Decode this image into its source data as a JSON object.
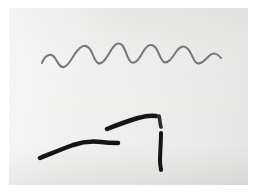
{
  "image": {
    "title": "Photographed paper with hand-drawn ink strokes",
    "canvas": {
      "width": 256,
      "height": 195
    },
    "background_color": "#ffffff",
    "plate": {
      "name": "photo-plate",
      "x": 9,
      "y": 8,
      "width": 239,
      "height": 177,
      "paper_color": "#ececeb",
      "grain": "subtle vertical paper texture, slightly darker toward right and bottom"
    },
    "ink_colors": {
      "wave": "#6d6d6d",
      "stroke_dark": "#151515",
      "stroke_mid": "#2a2a2a"
    },
    "strokes": [
      {
        "name": "sine-wave",
        "kind": "wavy-line",
        "color": "#6d6d6d",
        "stroke_width": 2.0,
        "description": "Thin gray hand-drawn sinusoid, about seven oscillations, amplitude grows from left then the tail flattens out to the right",
        "start": [
          42,
          62
        ],
        "end": [
          221,
          67
        ],
        "path": "M42,63 C45,55 51,52 55,58 C58,63 60,68 64,67 C69,66 72,57 77,51 C81,46 85,44 89,48 C93,52 94,61 98,63 C102,65 106,59 110,52 C114,45 118,41 122,45 C126,49 127,59 131,62 C135,65 139,59 143,52 C147,45 151,43 155,47 C159,51 160,60 164,62 C168,64 172,58 176,52 C180,46 184,45 188,49 C192,53 193,61 197,63 C201,65 205,60 209,56 C213,52 217,53 221,58"
      },
      {
        "name": "lower-left-stroke",
        "kind": "bent-line",
        "color": "#151515",
        "stroke_width": 4.5,
        "description": "Thick black stroke rising from lower-left, bending near its middle into a nearly horizontal tapering tail to the right",
        "start": [
          40,
          158
        ],
        "end": [
          118,
          143
        ],
        "path": "M40,158 C50,154 62,149 73,145 C82,142 92,141 101,142 C108,143 113,143 118,143"
      },
      {
        "name": "upper-right-diagonal-stroke",
        "kind": "straight-line",
        "color": "#151515",
        "stroke_width": 4.5,
        "description": "Thick black diagonal stroke sloping up to the right, slightly curved, above the left stroke",
        "start": [
          107,
          129
        ],
        "end": [
          156,
          116
        ],
        "path": "M107,129 C117,125 128,121 138,118 C145,116 151,115 156,116"
      },
      {
        "name": "vertical-stroke-upper-segment",
        "kind": "straight-line",
        "color": "#2a2a2a",
        "stroke_width": 3.6,
        "description": "Short upper piece of the broken vertical stroke, just below the diagonal's right end",
        "start": [
          159,
          116
        ],
        "end": [
          161,
          127
        ],
        "path": "M159,116 C160,120 160,124 161,127"
      },
      {
        "name": "vertical-stroke-lower-segment",
        "kind": "straight-line",
        "color": "#151515",
        "stroke_width": 4.0,
        "description": "Long lower piece of the broken vertical stroke, running down to the lower area of the plate",
        "start": [
          161,
          133
        ],
        "end": [
          161,
          170
        ],
        "path": "M161,133 C161,143 160,153 160,161 C160,165 161,168 161,170"
      }
    ],
    "gaps": [
      {
        "name": "vertical-stroke-gap",
        "between": [
          "vertical-stroke-upper-segment",
          "vertical-stroke-lower-segment"
        ],
        "y_range": [
          127,
          133
        ],
        "description": "Small white break in the vertical stroke"
      }
    ]
  }
}
